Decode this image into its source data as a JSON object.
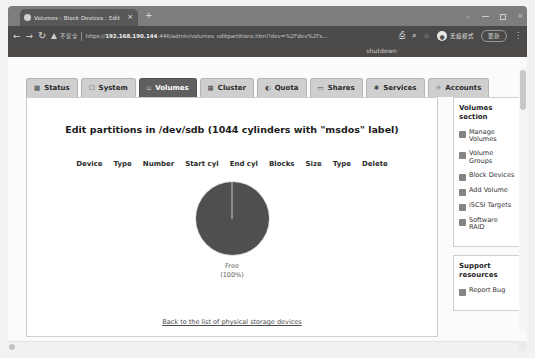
{
  "browser": {
    "tab": {
      "title": "Volumes : Block Devices : Edit",
      "favicon": "globe-icon",
      "close": "×"
    },
    "new_tab": "+",
    "window_controls": {
      "chevron": "⌄",
      "minimize": "",
      "maximize": "",
      "close": "×"
    },
    "nav": {
      "back": "←",
      "forward": "→",
      "reload": "↻"
    },
    "omnibox": {
      "security_label": "不安全",
      "url_scheme": "https://",
      "url_host": "192.168.190.144",
      "url_rest": ":446/admin/volumes_editpartitions.html?dev=%2Fdev%2Fs…",
      "share_icon": "⎙",
      "zoom_icon": "⌕",
      "bookmark_icon": "☆"
    },
    "profile": {
      "avatar_glyph": "●",
      "label": "无痕模式"
    },
    "update_button": "更新",
    "menu": "⋮"
  },
  "page": {
    "shutdown_link": "shutdown",
    "tabs": [
      {
        "label": "Status",
        "icon": "chart-icon",
        "active": false
      },
      {
        "label": "System",
        "icon": "box-icon",
        "active": false
      },
      {
        "label": "Volumes",
        "icon": "disk-icon",
        "active": true
      },
      {
        "label": "Cluster",
        "icon": "cluster-icon",
        "active": false
      },
      {
        "label": "Quota",
        "icon": "gauge-icon",
        "active": false
      },
      {
        "label": "Shares",
        "icon": "folder-icon",
        "active": false
      },
      {
        "label": "Services",
        "icon": "gear-icon",
        "active": false
      },
      {
        "label": "Accounts",
        "icon": "user-icon",
        "active": false
      }
    ],
    "title": "Edit partitions in /dev/sdb (1044 cylinders with \"msdos\" label)",
    "table_headers": [
      "Device",
      "Type",
      "Number",
      "Start cyl",
      "End cyl",
      "Blocks",
      "Size",
      "Type",
      "Delete"
    ],
    "back_link": "Back to the list of physical storage devices"
  },
  "chart_data": {
    "type": "pie",
    "title": "",
    "categories": [
      "Free"
    ],
    "values": [
      100
    ],
    "labels": [
      "Free",
      "(100%)"
    ],
    "colors": [
      "#4f4f4f"
    ],
    "legend_position": "bottom",
    "label_line1": "Free",
    "label_line2": "(100%)"
  },
  "sidebar": {
    "sections": [
      {
        "title": "Volumes section",
        "items": [
          {
            "label": "Manage Volumes",
            "icon": "volume-icon"
          },
          {
            "label": "Volume Groups",
            "icon": "group-icon"
          },
          {
            "label": "Block Devices",
            "icon": "block-icon"
          },
          {
            "label": "Add Volume",
            "icon": "plus-icon"
          },
          {
            "label": "iSCSI Targets",
            "icon": "target-icon"
          },
          {
            "label": "Software RAID",
            "icon": "raid-icon"
          }
        ]
      },
      {
        "title": "Support resources",
        "items": [
          {
            "label": "Report Bug",
            "icon": "bug-icon"
          }
        ]
      }
    ]
  },
  "colors": {
    "chrome_tabstrip": "#7d7d7d",
    "chrome_omnibox": "#4a4a4a",
    "active_tab": "#5f5f5f",
    "inactive_tab": "#cfcfcf",
    "pie_slice": "#4f4f4f",
    "page_banner": "#4d4a48"
  }
}
